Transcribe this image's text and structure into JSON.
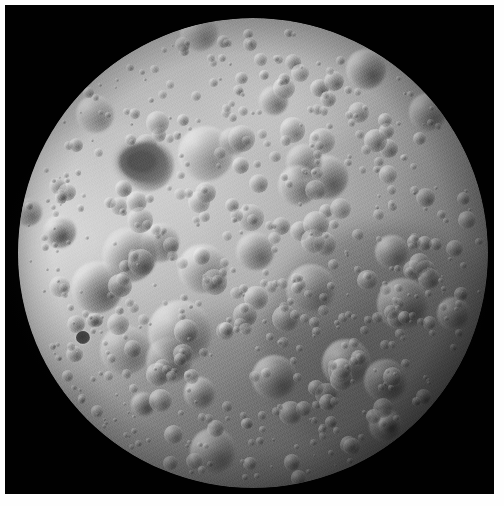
{
  "image": {
    "kind": "photograph",
    "subject": "Moon",
    "view": "full-disc far side",
    "palette": "grayscale",
    "width": 504,
    "height": 506
  },
  "frame": {
    "border_color": "#fefefe",
    "border_px": 5,
    "plate_color": "#010101",
    "plate_x": 5,
    "plate_y": 5,
    "plate_width": 489,
    "plate_height": 489
  },
  "moon": {
    "center_x": 248,
    "center_y": 248,
    "radius": 235,
    "disc_left": 18,
    "disc_top": 18,
    "disc_right": 487,
    "disc_bottom": 488,
    "base_color": "#a8a8a8",
    "highlight_color": "#c9c9c9",
    "shadow_color": "#2a2a2a",
    "terminator_direction": "south-east limb",
    "illumination_origin": "upper-left"
  },
  "regions": [
    {
      "name": "western-highlands",
      "label": "Bright western highlands",
      "tone": "#dcdcdc",
      "left_pct": -4,
      "top_pct": 22,
      "width_pct": 46,
      "height_pct": 56
    },
    {
      "name": "western-limb-band",
      "label": "Bright western limb band",
      "tone": "#f0f0f0",
      "left_pct": 0,
      "top_pct": 14,
      "width_pct": 17,
      "height_pct": 68
    },
    {
      "name": "southeast-basin",
      "label": "Darker smooth south-east basin",
      "tone": "#4a4a4a",
      "left_pct": 52,
      "top_pct": 44,
      "width_pct": 52,
      "height_pct": 52
    },
    {
      "name": "south-dusky",
      "label": "Dusky south-polar terrain",
      "tone": "#5e5e5e",
      "left_pct": 24,
      "top_pct": 62,
      "width_pct": 54,
      "height_pct": 38
    },
    {
      "name": "north-bright-splash",
      "label": "Bright north-central splash",
      "tone": "#e4e4e4",
      "left_pct": 38,
      "top_pct": 2,
      "width_pct": 40,
      "height_pct": 26
    }
  ],
  "features": [
    {
      "name": "dark-mare-patch",
      "label": "Dark mare patch (north-west quadrant)",
      "tone": "#4d4d4d",
      "left_pct": 21.5,
      "top_pct": 26.5,
      "width_pct": 10.5,
      "height_pct": 8.5
    },
    {
      "name": "dark-floor-crater-west",
      "label": "Small dark-floored crater (west)",
      "tone": "#3a3a3a",
      "left_pct": 12.3,
      "top_pct": 66.5,
      "width_pct": 3.0,
      "height_pct": 2.8
    }
  ],
  "crater_field": {
    "seed": 20240613,
    "counts": {
      "large": 34,
      "medium": 130,
      "small": 420
    },
    "large_radius_pct": [
      3.2,
      7.4
    ],
    "medium_radius_pct": [
      1.4,
      3.2
    ],
    "small_radius_pct": [
      0.45,
      1.4
    ],
    "rim_highlight": "rgba(246,246,246,0.55)",
    "floor_shadow": "rgba(34,34,34,0.55)",
    "sun_azimuth_deg": 315,
    "density_note": "saturated cratering, densest across the northern and southern highlands"
  },
  "grain": {
    "opacity": 0.4,
    "blend_mode": "overlay"
  }
}
